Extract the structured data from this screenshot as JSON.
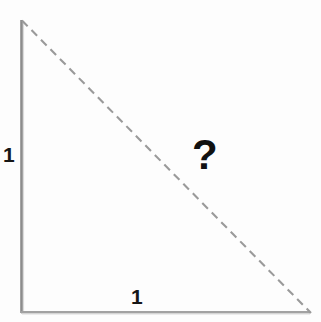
{
  "figure": {
    "background_color": "#fdfdfd",
    "width": 321,
    "height": 322,
    "labels": {
      "vertical_leg": "1",
      "horizontal_leg": "1",
      "hypotenuse": "?"
    },
    "colors": {
      "leg_stroke": "#8c8c8c",
      "horizontal_leg_stroke": "#a9a9a9",
      "hypotenuse_stroke": "#9a9a9a",
      "label_text": "#161616",
      "question_text": "#111111"
    },
    "geometry": {
      "vertex_top_left": [
        21,
        20
      ],
      "vertex_bottom_left": [
        21,
        313
      ],
      "vertex_bottom_right": [
        310,
        313
      ],
      "vertical_leg_length_px": 293,
      "horizontal_leg_length_px": 289,
      "hypotenuse_dash_pattern": "8,5",
      "hypotenuse_stroke_width": 2,
      "leg_stroke_width": 2.5
    }
  }
}
